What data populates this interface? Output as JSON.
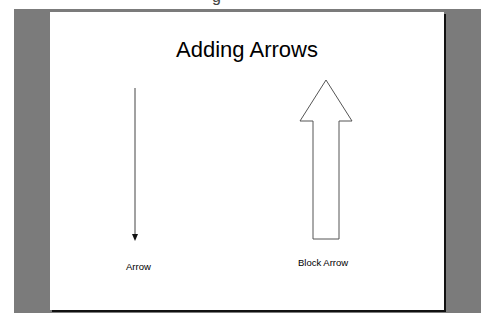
{
  "top_fragment": "g",
  "slide": {
    "title": "Adding Arrows",
    "shapes": [
      {
        "type": "arrow",
        "label": "Arrow",
        "direction": "down"
      },
      {
        "type": "block-arrow",
        "label": "Block Arrow",
        "direction": "up"
      }
    ]
  },
  "colors": {
    "background_gray": "#7b7b7b",
    "slide": "#ffffff",
    "shape_stroke": "#333333"
  }
}
